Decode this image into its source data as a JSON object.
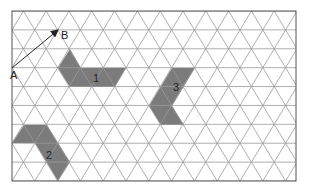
{
  "diagram": {
    "type": "triangular-grid",
    "frame": {
      "x": 12,
      "y": 11,
      "width": 284,
      "height": 170
    },
    "grid": {
      "rows": 9,
      "side": 22.8,
      "row_height": 18.9
    },
    "colors": {
      "grid": "#9a9a9a",
      "frame": "#555555",
      "shape_fill": "#7b7b7b",
      "arrow": "#222222"
    },
    "vector": {
      "start_label": "A",
      "end_label": "B",
      "start": [
        12,
        68
      ],
      "end": [
        58,
        30
      ]
    },
    "shapes": [
      {
        "label": "1",
        "points": [
          [
            70,
            49
          ],
          [
            81,
            68
          ],
          [
            126,
            68
          ],
          [
            115,
            87
          ],
          [
            70,
            87
          ],
          [
            58,
            68
          ]
        ],
        "label_pos": [
          93,
          82
        ]
      },
      {
        "label": "2",
        "points": [
          [
            24,
            125
          ],
          [
            47,
            125
          ],
          [
            70,
            162
          ],
          [
            58,
            181
          ],
          [
            35,
            143
          ],
          [
            12,
            143
          ]
        ],
        "label_pos": [
          46,
          159
        ]
      },
      {
        "label": "3",
        "points": [
          [
            172,
            68
          ],
          [
            195,
            68
          ],
          [
            172,
            106
          ],
          [
            184,
            125
          ],
          [
            161,
            125
          ],
          [
            149,
            106
          ]
        ],
        "label_pos": [
          173,
          91
        ]
      }
    ]
  }
}
